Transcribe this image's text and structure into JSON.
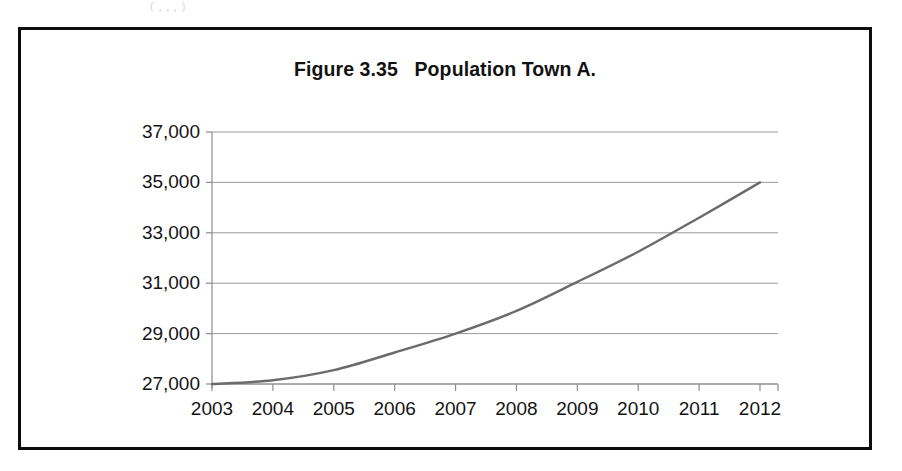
{
  "page": {
    "bleed_text": "(                  ,                  ,                  ,              )"
  },
  "figure": {
    "title": "Figure 3.35   Population Town A.",
    "frame_color": "#0d0d0d"
  },
  "chart_data": {
    "type": "line",
    "title": "Figure 3.35   Population Town A.",
    "xlabel": "",
    "ylabel": "",
    "categories": [
      "2003",
      "2004",
      "2005",
      "2006",
      "2007",
      "2008",
      "2009",
      "2010",
      "2011",
      "2012"
    ],
    "x": [
      2003,
      2004,
      2005,
      2006,
      2007,
      2008,
      2009,
      2010,
      2011,
      2012
    ],
    "values": [
      27000,
      27150,
      27550,
      28250,
      29000,
      29900,
      31050,
      32250,
      33600,
      35000
    ],
    "series": [
      {
        "name": "Population Town A",
        "values": [
          27000,
          27150,
          27550,
          28250,
          29000,
          29900,
          31050,
          32250,
          33600,
          35000
        ],
        "color": "#6b6b6b"
      }
    ],
    "ylim": [
      27000,
      37000
    ],
    "xlim": [
      2003,
      2012
    ],
    "y_ticks": [
      27000,
      29000,
      31000,
      33000,
      35000,
      37000
    ],
    "y_tick_labels": [
      "27,000",
      "29,000",
      "31,000",
      "33,000",
      "35,000",
      "37,000"
    ],
    "x_ticks": [
      2003,
      2004,
      2005,
      2006,
      2007,
      2008,
      2009,
      2010,
      2011,
      2012
    ],
    "x_tick_labels": [
      "2003",
      "2004",
      "2005",
      "2006",
      "2007",
      "2008",
      "2009",
      "2010",
      "2011",
      "2012"
    ],
    "grid": "horizontal",
    "grid_color": "#9a9a9a",
    "axis_color": "#8d8d8d",
    "legend": "none",
    "legend_position": "none"
  }
}
